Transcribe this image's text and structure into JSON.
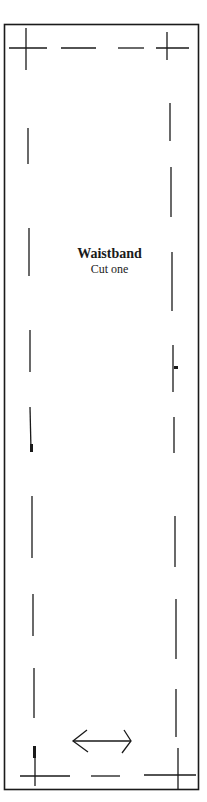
{
  "pattern": {
    "piece_name": "Waistband",
    "instruction": "Cut one",
    "grainline": "horizontal double-headed arrow",
    "line_color": "#1a1a1a",
    "background": "#ffffff"
  }
}
